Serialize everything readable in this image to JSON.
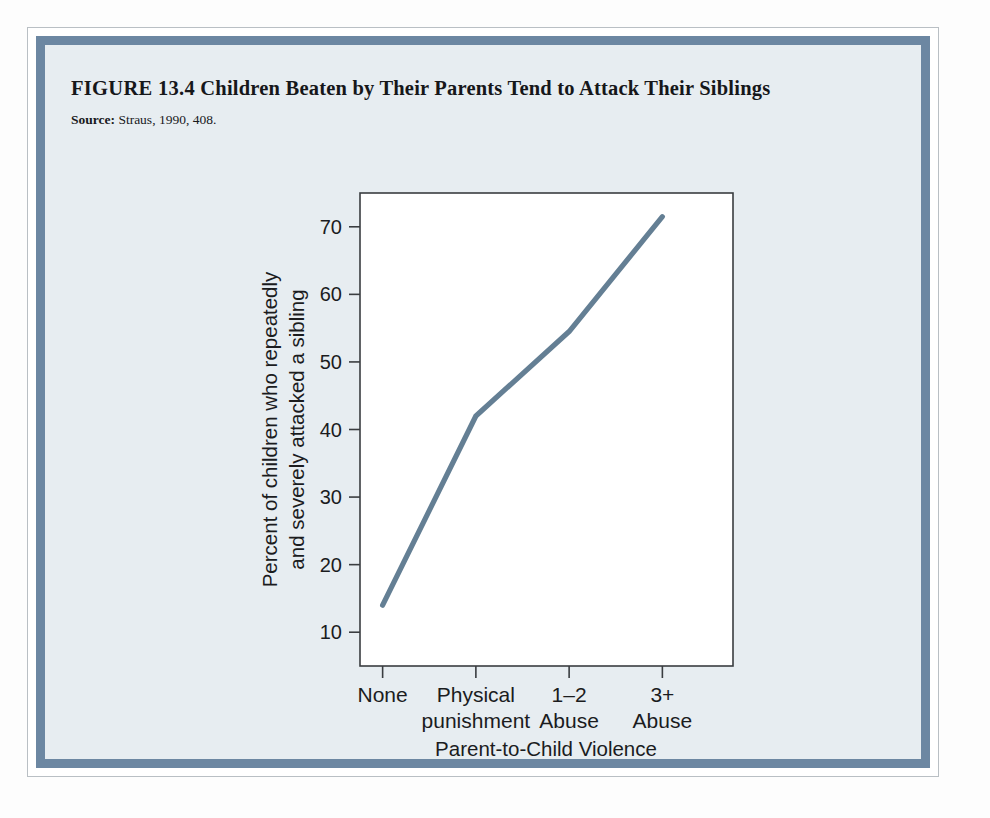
{
  "figure": {
    "number": "FIGURE 13.4",
    "title": "Children Beaten by Their Parents Tend to Attack Their Siblings",
    "source_label": "Source:",
    "source_text": "Straus, 1990, 408."
  },
  "colors": {
    "line": "#647f94",
    "border_band": "#6c87a2",
    "paper": "#e7edf1",
    "plot_bg": "#ffffff",
    "axis": "#3a3d40",
    "text": "#1b1c1e"
  },
  "chart_data": {
    "type": "line",
    "title": "Children Beaten by Their Parents Tend to Attack Their Siblings",
    "subtitle": "",
    "xlabel": "Parent-to-Child Violence",
    "ylabel": "Percent of children who repeatedly and severely attacked a sibling",
    "ylabel_line1": "Percent of children who repeatedly",
    "ylabel_line2": "and severely attacked a sibling",
    "categories": [
      "None",
      "Physical punishment",
      "1–2 Abuse",
      "3+ Abuse"
    ],
    "category_lines": [
      [
        "None"
      ],
      [
        "Physical",
        "punishment"
      ],
      [
        "1–2",
        "Abuse"
      ],
      [
        "3+",
        "Abuse"
      ]
    ],
    "values": [
      14,
      42,
      54.5,
      71.5
    ],
    "ylim": [
      5,
      75
    ],
    "yticks": [
      10,
      20,
      30,
      40,
      50,
      60,
      70
    ],
    "ytick_labels": [
      "10",
      "20",
      "30",
      "40",
      "50",
      "60",
      "70"
    ],
    "grid": false,
    "legend": false,
    "series": [
      {
        "name": "Percent of children who repeatedly and severely attacked a sibling",
        "values": [
          14,
          42,
          54.5,
          71.5
        ]
      }
    ]
  }
}
